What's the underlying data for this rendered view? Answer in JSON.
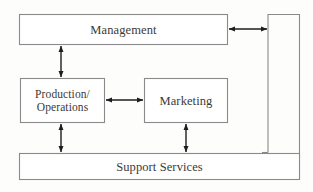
{
  "diagram": {
    "type": "block-flow-diagram",
    "background_color": "#fefefe",
    "box_border_color": "#8a8a8a",
    "box_fill_color": "#ffffff",
    "arrow_color": "#222222",
    "text_color": "#3a3a3a",
    "nodes": [
      {
        "id": "management",
        "label": "Management",
        "shape": "rectangle",
        "x": 19,
        "y": 14,
        "width": 209,
        "height": 31
      },
      {
        "id": "production_operations",
        "label": "Production/\nOperations",
        "shape": "rectangle",
        "x": 20,
        "y": 78,
        "width": 85,
        "height": 45
      },
      {
        "id": "marketing",
        "label": "Marketing",
        "shape": "rectangle",
        "x": 144,
        "y": 78,
        "width": 84,
        "height": 45
      },
      {
        "id": "support_services",
        "label": "Support Services",
        "shape": "rectangle",
        "x": 19,
        "y": 153,
        "width": 281,
        "height": 27
      },
      {
        "id": "right_connector",
        "label": "",
        "shape": "vertical-connector-channel",
        "x": 268,
        "y": 14,
        "width": 32,
        "height": 139
      }
    ],
    "connectors": [
      {
        "id": "management-to-production",
        "from": "management",
        "to": "production_operations",
        "orientation": "vertical",
        "arrowheads": "both",
        "x1": 61,
        "y1": 45,
        "x2": 61,
        "y2": 78
      },
      {
        "id": "production-to-marketing",
        "from": "production_operations",
        "to": "marketing",
        "orientation": "horizontal",
        "arrowheads": "both",
        "x1": 105,
        "y1": 100,
        "x2": 144,
        "y2": 100
      },
      {
        "id": "production-to-support",
        "from": "production_operations",
        "to": "support_services",
        "orientation": "vertical",
        "arrowheads": "both",
        "x1": 61,
        "y1": 123,
        "x2": 61,
        "y2": 153
      },
      {
        "id": "marketing-to-support",
        "from": "marketing",
        "to": "support_services",
        "orientation": "vertical",
        "arrowheads": "both",
        "x1": 186,
        "y1": 123,
        "x2": 186,
        "y2": 153
      },
      {
        "id": "management-to-right-connector",
        "from": "management",
        "to": "right_connector",
        "orientation": "horizontal",
        "arrowheads": "both",
        "x1": 228,
        "y1": 29,
        "x2": 268,
        "y2": 29
      }
    ]
  },
  "labels": {
    "management": "Management",
    "production_operations": "Production/\nOperations",
    "marketing": "Marketing",
    "support_services": "Support Services"
  }
}
